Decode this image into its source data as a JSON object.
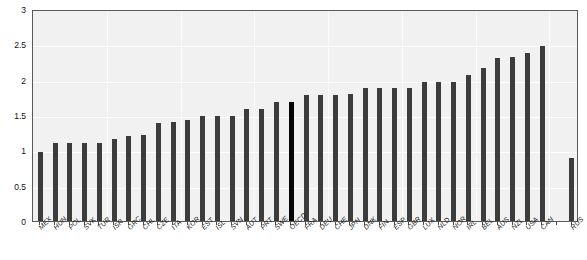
{
  "chart_data": {
    "type": "bar",
    "title": "",
    "xlabel": "",
    "ylabel": "",
    "ylim": [
      0,
      3
    ],
    "yticks": [
      0,
      0.5,
      1,
      1.5,
      2,
      2.5,
      3
    ],
    "ytick_labels": [
      "0",
      "0.5",
      "1",
      "1.5",
      "2",
      "2.5",
      "3"
    ],
    "grid": true,
    "legend": "none",
    "categories": [
      "MEX",
      "HUN",
      "POL",
      "SVK",
      "TUR",
      "ISR",
      "GRC",
      "CHL",
      "CZE",
      "ITA",
      "KOR",
      "EST",
      "ISL",
      "SVN",
      "AUT",
      "PRT",
      "SWE",
      "OECD",
      "FRA",
      "DEU",
      "CHE",
      "JPN",
      "DNK",
      "FIN",
      "ESP",
      "GBR",
      "LUX",
      "NLD",
      "NOR",
      "IRL",
      "BEL",
      "AUS",
      "NZL",
      "USA",
      "CAN",
      "",
      "RUS"
    ],
    "values": [
      0.97,
      1.1,
      1.1,
      1.1,
      1.1,
      1.16,
      1.2,
      1.22,
      1.39,
      1.4,
      1.43,
      1.49,
      1.49,
      1.49,
      1.59,
      1.59,
      1.68,
      1.68,
      1.78,
      1.78,
      1.78,
      1.8,
      1.88,
      1.88,
      1.88,
      1.88,
      1.97,
      1.97,
      1.97,
      2.07,
      2.17,
      2.3,
      2.32,
      2.38,
      2.48,
      null,
      0.89
    ],
    "highlight_category": "OECD",
    "bar_color": "#3c3c3c",
    "highlight_color": "#060606",
    "plot_background": "#f1f1f1",
    "gridline_color": "#ffffff",
    "axis_color": "#5a5a5a"
  }
}
